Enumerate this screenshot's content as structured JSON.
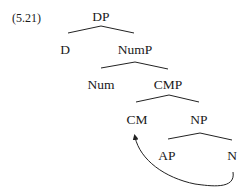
{
  "example_number": "(5.21)",
  "tree": {
    "root": "DP",
    "nodes": {
      "dp": "DP",
      "d": "D",
      "nump": "NumP",
      "num": "Num",
      "cmp": "CMP",
      "cm": "CM",
      "np": "NP",
      "ap": "AP",
      "n": "N"
    },
    "edges": [
      [
        "DP",
        "D"
      ],
      [
        "DP",
        "NumP"
      ],
      [
        "NumP",
        "Num"
      ],
      [
        "NumP",
        "CMP"
      ],
      [
        "CMP",
        "CM"
      ],
      [
        "CMP",
        "NP"
      ],
      [
        "NP",
        "AP"
      ],
      [
        "NP",
        "N"
      ]
    ],
    "movement_arrow": {
      "from": "N",
      "to": "CM"
    }
  }
}
